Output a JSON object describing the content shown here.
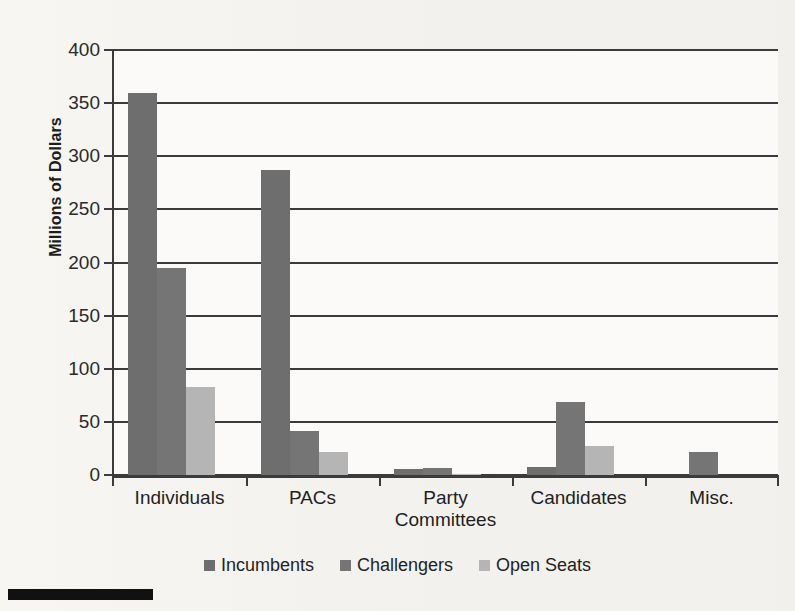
{
  "chart_data": {
    "type": "bar",
    "title": "",
    "subtitle": "",
    "xlabel": "",
    "ylabel": "Millions of Dollars",
    "ylim": [
      0,
      400
    ],
    "ytick_labels": [
      "400",
      "350",
      "300",
      "250",
      "200",
      "150",
      "100",
      "50",
      "0"
    ],
    "ytick_values": [
      400,
      350,
      300,
      250,
      200,
      150,
      100,
      50,
      0
    ],
    "ytick_step": 50,
    "grid": true,
    "grid_axis": "y",
    "legend_position": "bottom",
    "categories": [
      "Individuals",
      "PACs",
      "Party Committees",
      "Candidates",
      "Misc."
    ],
    "category_lines": [
      [
        "Individuals"
      ],
      [
        "PACs"
      ],
      [
        "Party",
        "Committees"
      ],
      [
        "Candidates"
      ],
      [
        "Misc."
      ]
    ],
    "series": [
      {
        "name": "Incumbents",
        "color": "#6e6e6e",
        "values": [
          360,
          287,
          6,
          8,
          0
        ]
      },
      {
        "name": "Challengers",
        "color": "#757575",
        "values": [
          195,
          41,
          7,
          69,
          22
        ]
      },
      {
        "name": "Open Seats",
        "color": "#b5b5b5",
        "values": [
          83,
          22,
          1,
          27,
          0
        ]
      }
    ]
  },
  "legend": {
    "items": [
      {
        "label": "Incumbents",
        "color": "#6e6e6e"
      },
      {
        "label": "Challengers",
        "color": "#757575"
      },
      {
        "label": "Open Seats",
        "color": "#b5b5b5"
      }
    ]
  },
  "axis": {
    "y_title": "Millions of Dollars"
  },
  "decor": {
    "bottom_rule_color": "#111111"
  }
}
